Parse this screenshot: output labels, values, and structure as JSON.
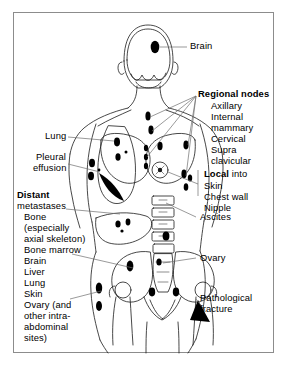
{
  "figure": {
    "kind": "medical-anatomical-diagram",
    "border_color": "#8c8c8c",
    "ink_color": "#000000",
    "lesion_color": "#000000",
    "background": "#ffffff"
  },
  "labels": {
    "brain": "Brain",
    "lung": "Lung",
    "pleural_effusion_line1": "Pleural",
    "pleural_effusion_line2": "effusion",
    "ascites": "Ascites",
    "ovary": "Ovary",
    "pathological_fracture_line1": "Pathological",
    "pathological_fracture_line2": "fracture"
  },
  "regional_nodes": {
    "heading": "Regional nodes",
    "items": [
      "Axillary",
      "Internal",
      "mammary",
      "Cervical",
      "Supra",
      "clavicular"
    ]
  },
  "local": {
    "heading_bold": "Local",
    "heading_rest": " into",
    "items": [
      "Skin",
      "Chest wall",
      "Nipple"
    ]
  },
  "distant": {
    "heading_bold": "Distant",
    "heading_rest": "metastases",
    "items": [
      "Bone",
      "(especially",
      "axial skeleton)",
      "Bone marrow",
      "Brain",
      "Liver",
      "Lung",
      "Skin",
      "Ovary (and",
      "other intra-",
      "abdominal",
      "sites)"
    ]
  }
}
